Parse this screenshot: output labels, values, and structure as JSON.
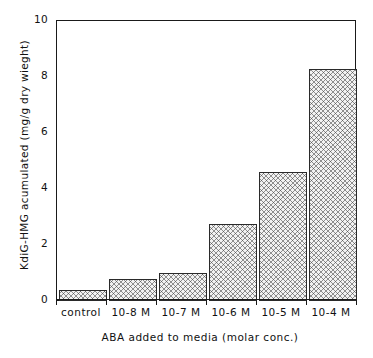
{
  "chart_data": {
    "type": "bar",
    "title": "",
    "categories": [
      "control",
      "10-8 M",
      "10-7 M",
      "10-6 M",
      "10-5 M",
      "10-4 M"
    ],
    "values": [
      0.4,
      0.78,
      1.0,
      2.75,
      4.6,
      8.3
    ],
    "xlabel": "ABA added to media (molar conc.)",
    "ylabel": "KdiG-HMG acumulated  (mg/g  dry  wieght)",
    "ylim": [
      0,
      10
    ],
    "y_ticks": [
      0,
      2,
      4,
      6,
      8,
      10
    ],
    "y_tick_labels": [
      "0",
      "2",
      "4",
      "6",
      "8",
      "10"
    ],
    "y_minor_ticks": [
      1,
      3,
      5,
      7,
      9
    ],
    "grid": false,
    "legend": false,
    "bar_fill": "#f2f2f2",
    "bar_edge": "#2a2a2a",
    "bar_pattern": "crosshatch",
    "axis_color": "#1a1a1a"
  },
  "axes": {
    "y_title": "KdiG-HMG acumulated  (mg/g  dry  wieght)",
    "x_title": "ABA added to media (molar conc.)"
  }
}
